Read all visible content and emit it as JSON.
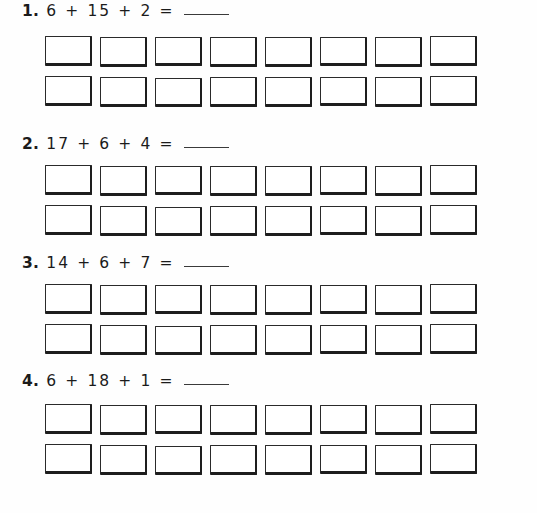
{
  "worksheet": {
    "boxes_per_row": 8,
    "rows_per_problem": 2,
    "ink_color": "#1d1d1d",
    "paper_color": "#fefefe",
    "problems": [
      {
        "number": "1.",
        "expression": "6 + 15 + 2 =",
        "answer": ""
      },
      {
        "number": "2.",
        "expression": "17 + 6 + 4 =",
        "answer": ""
      },
      {
        "number": "3.",
        "expression": "14 + 6 + 7 =",
        "answer": ""
      },
      {
        "number": "4.",
        "expression": "6 + 18 + 1 =",
        "answer": ""
      }
    ]
  }
}
